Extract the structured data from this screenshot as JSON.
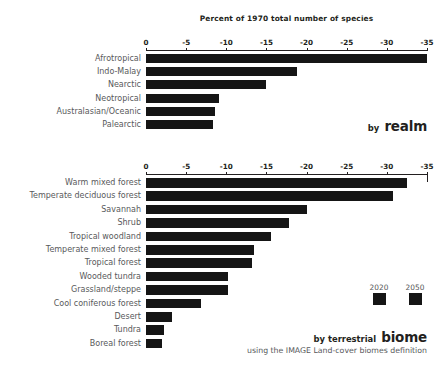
{
  "chart_data": [
    {
      "type": "bar",
      "orientation": "horizontal",
      "title": "Percent of 1970 total number of species",
      "panel_label_prefix": "by",
      "panel_label": "realm",
      "xlabel": "",
      "ylabel": "",
      "xlim": [
        0,
        -35
      ],
      "xticks": [
        0,
        -5,
        -10,
        -15,
        -20,
        -25,
        -30,
        -35
      ],
      "xtick_labels": [
        "0",
        "-5",
        "-10",
        "-15",
        "-20",
        "-25",
        "-30",
        "-35"
      ],
      "grid": false,
      "categories": [
        "Afrotropical",
        "Indo-Malay",
        "Nearctic",
        "Neotropical",
        "Australasian/Oceanic",
        "Palearctic"
      ],
      "values": [
        -35.0,
        -18.8,
        -15.0,
        -9.1,
        -8.6,
        -8.3
      ],
      "series": [
        {
          "name": "2020",
          "values": [
            -35.0,
            -18.8,
            -15.0,
            -9.1,
            -8.6,
            -8.3
          ]
        }
      ]
    },
    {
      "type": "bar",
      "orientation": "horizontal",
      "title": "",
      "panel_label_prefix": "by terrestrial",
      "panel_label": "biome",
      "panel_note": "using the IMAGE Land-cover biomes definition",
      "xlabel": "",
      "ylabel": "",
      "xlim": [
        0,
        -35
      ],
      "xticks": [
        0,
        -5,
        -10,
        -15,
        -20,
        -25,
        -30,
        -35
      ],
      "xtick_labels": [
        "0",
        "-5",
        "-10",
        "-15",
        "-20",
        "-25",
        "-30",
        "-35"
      ],
      "grid": false,
      "categories": [
        "Warm mixed forest",
        "Temperate deciduous forest",
        "Savannah",
        "Shrub",
        "Tropical woodland",
        "Temperate mixed forest",
        "Tropical forest",
        "Wooded tundra",
        "Grassland/steppe",
        "Cool coniferous forest",
        "Desert",
        "Tundra",
        "Boreal forest"
      ],
      "values": [
        -32.5,
        -30.8,
        -20.0,
        -17.8,
        -15.6,
        -13.5,
        -13.2,
        -10.2,
        -10.2,
        -6.9,
        -3.2,
        -2.3,
        -2.0
      ],
      "series": [
        {
          "name": "2020",
          "values": [
            -32.5,
            -30.8,
            -20.0,
            -17.8,
            -15.6,
            -13.5,
            -13.2,
            -10.2,
            -10.2,
            -6.9,
            -3.2,
            -2.3,
            -2.0
          ]
        }
      ],
      "legend": {
        "position": "inside-right",
        "entries": [
          {
            "label": "2020",
            "color": "#151515"
          },
          {
            "label": "2050",
            "color": "#151515"
          }
        ]
      }
    }
  ],
  "realm_panel": {
    "title": "Percent of 1970 total number of species",
    "axis_ticks": [
      "0",
      "-5",
      "-10",
      "-15",
      "-20",
      "-25",
      "-30",
      "-35"
    ],
    "rows": [
      {
        "label": "Afrotropical",
        "value": -35.0
      },
      {
        "label": "Indo-Malay",
        "value": -18.8
      },
      {
        "label": "Nearctic",
        "value": -15.0
      },
      {
        "label": "Neotropical",
        "value": -9.1
      },
      {
        "label": "Australasian/Oceanic",
        "value": -8.6
      },
      {
        "label": "Palearctic",
        "value": -8.3
      }
    ],
    "caption_prefix": "by",
    "caption_main": "realm"
  },
  "biome_panel": {
    "axis_ticks": [
      "0",
      "-5",
      "-10",
      "-15",
      "-20",
      "-25",
      "-30",
      "-35"
    ],
    "rows": [
      {
        "label": "Warm mixed forest",
        "value": -32.5
      },
      {
        "label": "Temperate deciduous forest",
        "value": -30.8
      },
      {
        "label": "Savannah",
        "value": -20.0
      },
      {
        "label": "Shrub",
        "value": -17.8
      },
      {
        "label": "Tropical woodland",
        "value": -15.6
      },
      {
        "label": "Temperate mixed forest",
        "value": -13.5
      },
      {
        "label": "Tropical forest",
        "value": -13.2
      },
      {
        "label": "Wooded tundra",
        "value": -10.2
      },
      {
        "label": "Grassland/steppe",
        "value": -10.2
      },
      {
        "label": "Cool coniferous forest",
        "value": -6.9
      },
      {
        "label": "Desert",
        "value": -3.2
      },
      {
        "label": "Tundra",
        "value": -2.3
      },
      {
        "label": "Boreal forest",
        "value": -2.0
      }
    ],
    "caption_prefix": "by terrestrial",
    "caption_main": "biome",
    "caption_note": "using the IMAGE Land-cover biomes definition",
    "legend": [
      {
        "label": "2020",
        "color": "#151515"
      },
      {
        "label": "2050",
        "color": "#151515"
      }
    ]
  },
  "colors": {
    "bar": "#151515",
    "label_text": "#58595b",
    "title_text": "#231f20",
    "background": "#ffffff"
  }
}
